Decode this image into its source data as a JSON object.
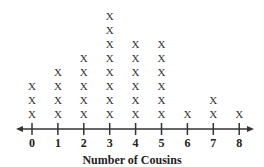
{
  "chart_data": {
    "type": "dot_plot",
    "title": "",
    "xlabel": "Number of Cousins",
    "ylabel": "",
    "categories": [
      "0",
      "1",
      "2",
      "3",
      "4",
      "5",
      "6",
      "7",
      "8"
    ],
    "values": [
      3,
      4,
      5,
      8,
      6,
      6,
      1,
      2,
      1
    ],
    "marker": "X",
    "xlim": [
      0,
      8
    ],
    "grid": false,
    "axis_arrows": "both"
  },
  "colors": {
    "axis": "#333333",
    "marker": "#333333"
  }
}
